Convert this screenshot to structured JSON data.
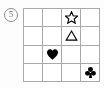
{
  "figure": {
    "index_label": "5",
    "index_label_shape": "circle",
    "grid": {
      "rows": 4,
      "cols": 4,
      "line_color": "#a9a9a9",
      "cell_background": "#ffffff"
    },
    "symbol_color": "#000000",
    "background_color": "#fdfdfd",
    "cells": [
      {
        "row": 1,
        "col": 1,
        "symbol": "",
        "symbol_name": "empty-cell",
        "fill": "none"
      },
      {
        "row": 1,
        "col": 2,
        "symbol": "",
        "symbol_name": "empty-cell",
        "fill": "none"
      },
      {
        "row": 1,
        "col": 3,
        "symbol": "star",
        "symbol_name": "star-outline-icon",
        "fill": "outline"
      },
      {
        "row": 1,
        "col": 4,
        "symbol": "",
        "symbol_name": "empty-cell",
        "fill": "none"
      },
      {
        "row": 2,
        "col": 1,
        "symbol": "",
        "symbol_name": "empty-cell",
        "fill": "none"
      },
      {
        "row": 2,
        "col": 2,
        "symbol": "",
        "symbol_name": "empty-cell",
        "fill": "none"
      },
      {
        "row": 2,
        "col": 3,
        "symbol": "triangle",
        "symbol_name": "triangle-outline-icon",
        "fill": "outline"
      },
      {
        "row": 2,
        "col": 4,
        "symbol": "",
        "symbol_name": "empty-cell",
        "fill": "none"
      },
      {
        "row": 3,
        "col": 1,
        "symbol": "",
        "symbol_name": "empty-cell",
        "fill": "none"
      },
      {
        "row": 3,
        "col": 2,
        "symbol": "heart",
        "symbol_name": "heart-filled-icon",
        "fill": "solid"
      },
      {
        "row": 3,
        "col": 3,
        "symbol": "",
        "symbol_name": "empty-cell",
        "fill": "none"
      },
      {
        "row": 3,
        "col": 4,
        "symbol": "",
        "symbol_name": "empty-cell",
        "fill": "none"
      },
      {
        "row": 4,
        "col": 1,
        "symbol": "",
        "symbol_name": "empty-cell",
        "fill": "none"
      },
      {
        "row": 4,
        "col": 2,
        "symbol": "",
        "symbol_name": "empty-cell",
        "fill": "none"
      },
      {
        "row": 4,
        "col": 3,
        "symbol": "",
        "symbol_name": "empty-cell",
        "fill": "none"
      },
      {
        "row": 4,
        "col": 4,
        "symbol": "club",
        "symbol_name": "club-filled-icon",
        "fill": "solid"
      }
    ]
  }
}
